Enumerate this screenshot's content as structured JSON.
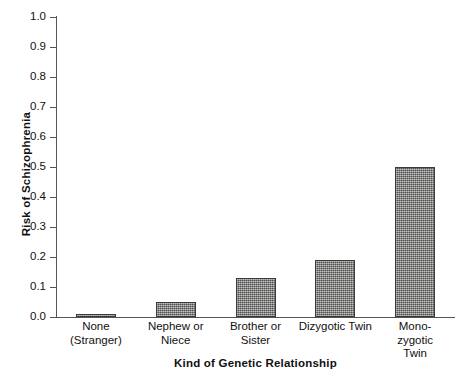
{
  "chart_data": {
    "type": "bar",
    "title": "",
    "xlabel": "Kind of Genetic Relationship",
    "ylabel": "Risk of Schizophrenia",
    "categories": [
      "None (Stranger)",
      "Nephew or Niece",
      "Brother or Sister",
      "Dizygotic Twin",
      "Monozygotic Twin"
    ],
    "category_lines": [
      [
        "None",
        "(Stranger)"
      ],
      [
        "Nephew or",
        "Niece"
      ],
      [
        "Brother or",
        "Sister"
      ],
      [
        "Dizygotic Twin"
      ],
      [
        "Mono-",
        "zygotic",
        "Twin"
      ]
    ],
    "values": [
      0.01,
      0.05,
      0.13,
      0.19,
      0.5
    ],
    "ylim": [
      0.0,
      1.0
    ],
    "yticks": [
      "1.0",
      "0.9",
      "0.8",
      "0.7",
      "0.6",
      "0.5",
      "0.4",
      "0.3",
      "0.2",
      "0.1",
      "0.0"
    ],
    "ytick_values": [
      1.0,
      0.9,
      0.8,
      0.7,
      0.6,
      0.5,
      0.4,
      0.3,
      0.2,
      0.1,
      0.0
    ],
    "grid": false,
    "legend": null,
    "bar_color": "#70706f",
    "bar_edge_color": "#3a3a3a",
    "axis_color": "#555555",
    "background_color": "#ffffff"
  }
}
